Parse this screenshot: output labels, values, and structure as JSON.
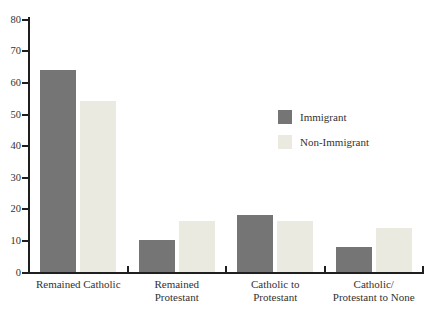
{
  "chart_data": {
    "type": "bar",
    "title": "",
    "xlabel": "",
    "ylabel": "",
    "categories": [
      "Remained Catholic",
      "Remained\nProtestant",
      "Catholic to\nProtestant",
      "Catholic/\nProtestant to None"
    ],
    "series": [
      {
        "name": "Immigrant",
        "color": "#757575",
        "values": [
          64,
          10,
          18,
          8
        ]
      },
      {
        "name": "Non-Immigrant",
        "color": "#ebeae0",
        "values": [
          54,
          16,
          16,
          14
        ]
      }
    ],
    "ylim": [
      0,
      80
    ],
    "ytick_step": 10,
    "ytick_labels": [
      "0",
      "10",
      "20",
      "30",
      "40",
      "50",
      "60",
      "70",
      "80"
    ],
    "grid": false,
    "legend_position": "center-right"
  },
  "colors": {
    "axis": "#1f1f1f",
    "text": "#323232",
    "background": "#ffffff",
    "immigrant_bar": "#757575",
    "non_immigrant_bar": "#ebeae0"
  }
}
